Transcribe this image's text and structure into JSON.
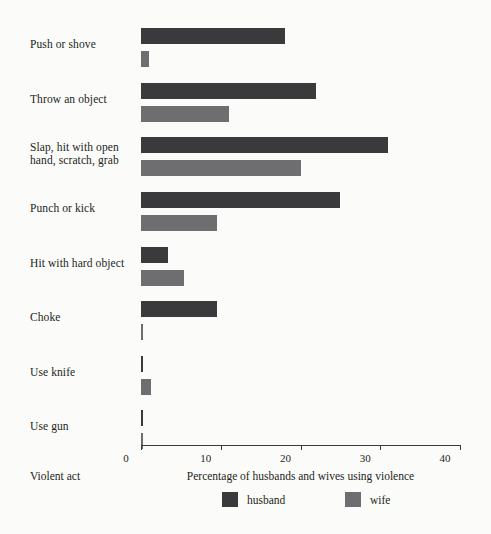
{
  "chart_data": {
    "type": "bar",
    "orientation": "horizontal",
    "title": "",
    "xlabel": "Percentage of husbands and wives using violence",
    "ylabel": "Violent act",
    "xlim": [
      0,
      40
    ],
    "xticks": [
      0,
      10,
      20,
      30,
      40
    ],
    "xtick_labels": [
      "0",
      "10",
      "20",
      "30",
      "40"
    ],
    "grid": false,
    "legend_position": "bottom",
    "categories": [
      "Push or shove",
      "Throw an object",
      "Slap, hit with open hand, scratch, grab",
      "Punch or kick",
      "Hit with hard object",
      "Choke",
      "Use knife",
      "Use gun"
    ],
    "category_display": [
      "Push or shove",
      "Throw an object",
      "Slap, hit with open\nhand, scratch, grab",
      "Punch or kick",
      "Hit with hard object",
      "Choke",
      "Use knife",
      "Use gun"
    ],
    "series": [
      {
        "name": "husband",
        "color": "#3a3a3c",
        "values": [
          18.0,
          22.0,
          31.0,
          25.0,
          3.4,
          9.5,
          0.3,
          0.3
        ]
      },
      {
        "name": "wife",
        "color": "#6e6e70",
        "values": [
          1.0,
          11.0,
          20.0,
          9.5,
          5.4,
          0.2,
          1.3,
          0.3
        ]
      }
    ]
  },
  "legend": {
    "items": [
      {
        "label": "husband",
        "color": "#3a3a3c"
      },
      {
        "label": "wife",
        "color": "#6e6e70"
      }
    ]
  },
  "axis": {
    "y_title": "Violent act",
    "x_title": "Percentage of husbands and wives using violence"
  }
}
